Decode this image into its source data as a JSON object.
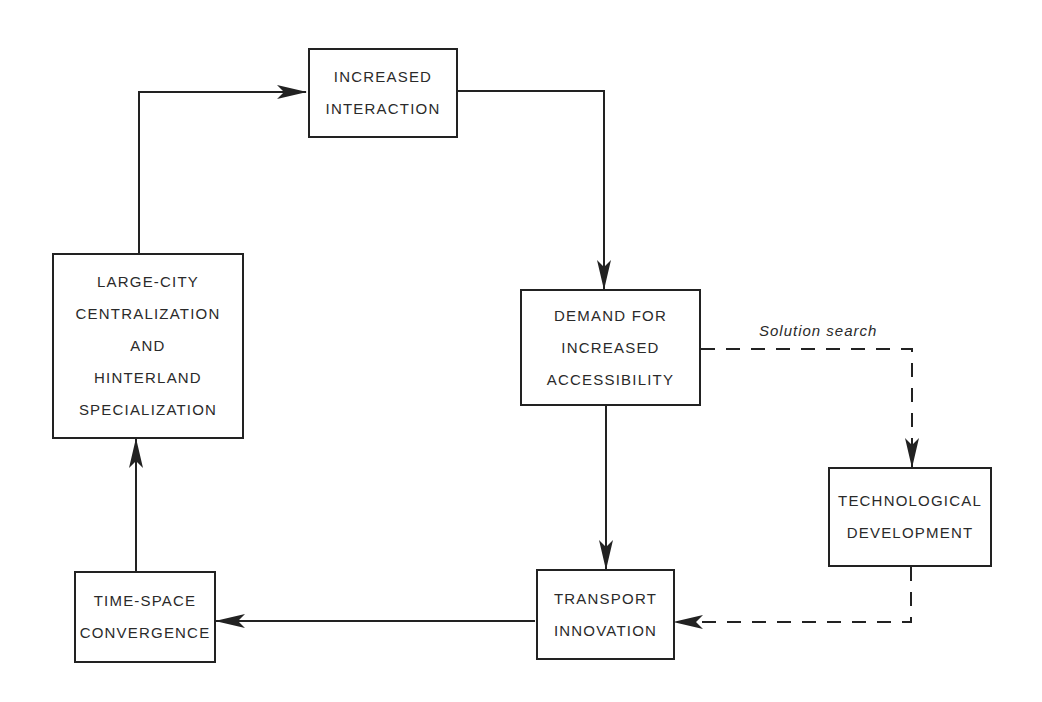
{
  "diagram": {
    "nodes": {
      "increased_interaction": {
        "lines": [
          "INCREASED",
          "INTERACTION"
        ]
      },
      "demand_accessibility": {
        "lines": [
          "DEMAND FOR",
          "INCREASED",
          "ACCESSIBILITY"
        ]
      },
      "large_city": {
        "lines": [
          "LARGE-CITY",
          "CENTRALIZATION",
          "AND",
          "HINTERLAND",
          "SPECIALIZATION"
        ]
      },
      "technological_development": {
        "lines": [
          "TECHNOLOGICAL",
          "DEVELOPMENT"
        ]
      },
      "transport_innovation": {
        "lines": [
          "TRANSPORT",
          "INNOVATION"
        ]
      },
      "time_space": {
        "lines": [
          "TIME-SPACE",
          "CONVERGENCE"
        ]
      }
    },
    "edges": [
      {
        "from": "Large-City Centralization and Hinterland Specialization",
        "to": "Increased Interaction",
        "style": "solid"
      },
      {
        "from": "Increased Interaction",
        "to": "Demand for Increased Accessibility",
        "style": "solid"
      },
      {
        "from": "Demand for Increased Accessibility",
        "to": "Transport Innovation",
        "style": "solid"
      },
      {
        "from": "Demand for Increased Accessibility",
        "to": "Technological Development",
        "style": "dashed",
        "label": "Solution search"
      },
      {
        "from": "Technological Development",
        "to": "Transport Innovation",
        "style": "dashed"
      },
      {
        "from": "Transport Innovation",
        "to": "Time-Space Convergence",
        "style": "solid"
      },
      {
        "from": "Time-Space Convergence",
        "to": "Large-City Centralization and Hinterland Specialization",
        "style": "solid"
      }
    ],
    "edge_label": "Solution search",
    "line_color": "#222222"
  }
}
